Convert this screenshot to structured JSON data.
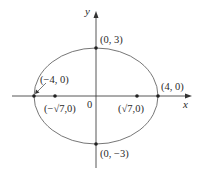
{
  "diagram": {
    "type": "ellipse-plot",
    "equation_implied": "x^2/16 + y^2/9 = 1",
    "axes": {
      "x_label": "x",
      "y_label": "y",
      "origin_label": "0"
    },
    "points": {
      "top_vertex": "(0, 3)",
      "bottom_vertex": "(0, −3)",
      "left_vertex": "(−4, 0)",
      "right_vertex": "(4, 0)",
      "left_focus": "(−√7,0)",
      "right_focus": "(√7,0)"
    },
    "colors": {
      "stroke": "#555555",
      "text": "#2a2a2a"
    }
  }
}
